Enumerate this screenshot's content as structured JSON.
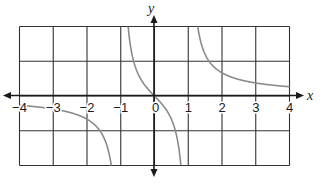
{
  "chart_data": {
    "type": "line",
    "title": "",
    "function": "y = x/(x^2 - 1)",
    "xlabel": "x",
    "ylabel": "y",
    "xlim": [
      -4,
      4
    ],
    "ylim": [
      -2,
      2
    ],
    "grid": true,
    "x_ticks": [
      "-4",
      "-3",
      "-2",
      "-1",
      "0",
      "1",
      "2",
      "3",
      "4"
    ],
    "vertical_asymptotes": [
      -1,
      1
    ],
    "horizontal_asymptote": 0,
    "series": [
      {
        "name": "branch-left",
        "x": [
          -4,
          -3,
          -2,
          -1.5,
          -1.25,
          -1.1
        ],
        "y": [
          -0.27,
          -0.375,
          -0.667,
          -1.2,
          -2.22,
          -5.24
        ]
      },
      {
        "name": "branch-middle",
        "x": [
          -0.9,
          -0.75,
          -0.5,
          0,
          0.5,
          0.75,
          0.9
        ],
        "y": [
          4.74,
          1.71,
          0.667,
          0,
          -0.667,
          -1.71,
          -4.74
        ]
      },
      {
        "name": "branch-right",
        "x": [
          1.1,
          1.25,
          1.5,
          2,
          3,
          4
        ],
        "y": [
          5.24,
          2.22,
          1.2,
          0.667,
          0.375,
          0.27
        ]
      }
    ]
  },
  "labels": {
    "x_axis": "x",
    "y_axis": "y",
    "ticks": [
      "−4",
      "−3",
      "−2",
      "−1",
      "0",
      "1",
      "2",
      "3",
      "4"
    ]
  }
}
